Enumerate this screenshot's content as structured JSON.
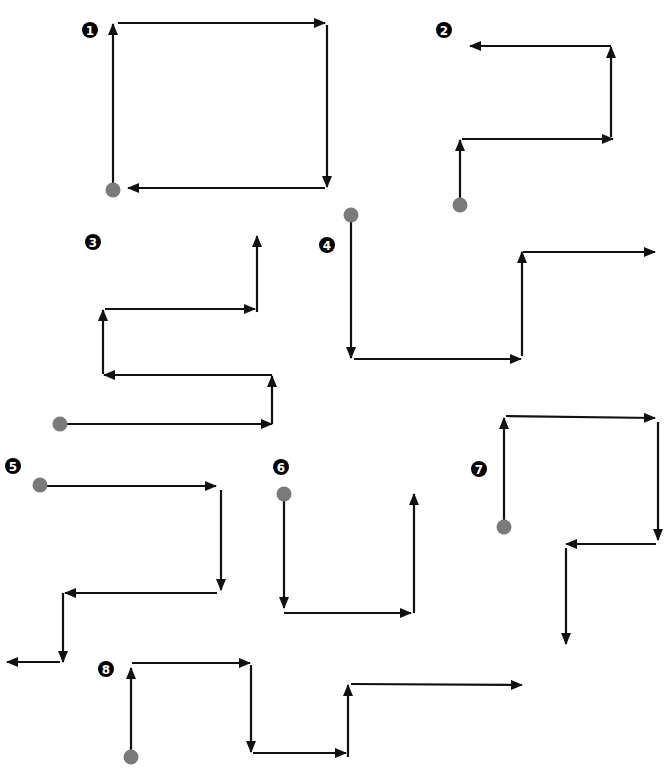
{
  "colors": {
    "arrow": "#111111",
    "start_dot": "#7a7a7a",
    "badge_bg": "#000000",
    "badge_text": "#ffffff",
    "background": "#ffffff"
  },
  "figures": [
    {
      "label": "1",
      "badge": [
        90,
        30
      ],
      "start": [
        113,
        190
      ],
      "segments": [
        [
          [
            113,
            184
          ],
          [
            113,
            24
          ]
        ],
        [
          [
            118,
            23
          ],
          [
            325,
            23
          ]
        ],
        [
          [
            327,
            25
          ],
          [
            327,
            187
          ]
        ],
        [
          [
            325,
            188
          ],
          [
            128,
            188
          ]
        ]
      ]
    },
    {
      "label": "2",
      "badge": [
        444,
        30
      ],
      "start": [
        460,
        205
      ],
      "segments": [
        [
          [
            460,
            199
          ],
          [
            460,
            140
          ]
        ],
        [
          [
            462,
            139
          ],
          [
            613,
            139
          ]
        ],
        [
          [
            611,
            137
          ],
          [
            611,
            47
          ]
        ],
        [
          [
            611,
            46
          ],
          [
            470,
            46
          ]
        ]
      ]
    },
    {
      "label": "3",
      "badge": [
        93,
        242
      ],
      "start": [
        60,
        424
      ],
      "segments": [
        [
          [
            66,
            424
          ],
          [
            272,
            424
          ]
        ],
        [
          [
            272,
            424
          ],
          [
            272,
            376
          ]
        ],
        [
          [
            272,
            375
          ],
          [
            104,
            375
          ]
        ],
        [
          [
            103,
            374
          ],
          [
            103,
            310
          ]
        ],
        [
          [
            105,
            309
          ],
          [
            255,
            309
          ]
        ],
        [
          [
            257,
            312
          ],
          [
            257,
            236
          ]
        ]
      ]
    },
    {
      "label": "4",
      "badge": [
        327,
        245
      ],
      "start": [
        351,
        215
      ],
      "segments": [
        [
          [
            351,
            221
          ],
          [
            351,
            358
          ]
        ],
        [
          [
            354,
            359
          ],
          [
            521,
            359
          ]
        ],
        [
          [
            522,
            356
          ],
          [
            522,
            252
          ]
        ],
        [
          [
            523,
            252
          ],
          [
            655,
            252
          ]
        ]
      ]
    },
    {
      "label": "5",
      "badge": [
        13,
        466
      ],
      "start": [
        40,
        485
      ],
      "segments": [
        [
          [
            46,
            486
          ],
          [
            216,
            486
          ]
        ],
        [
          [
            221,
            490
          ],
          [
            221,
            590
          ]
        ],
        [
          [
            217,
            593
          ],
          [
            65,
            593
          ]
        ],
        [
          [
            63,
            593
          ],
          [
            63,
            662
          ]
        ],
        [
          [
            60,
            662
          ],
          [
            7,
            662
          ]
        ]
      ]
    },
    {
      "label": "6",
      "badge": [
        281,
        467
      ],
      "start": [
        284,
        494
      ],
      "segments": [
        [
          [
            284,
            500
          ],
          [
            284,
            608
          ]
        ],
        [
          [
            284,
            613
          ],
          [
            411,
            613
          ]
        ],
        [
          [
            414,
            613
          ],
          [
            414,
            494
          ]
        ]
      ]
    },
    {
      "label": "7",
      "badge": [
        479,
        469
      ],
      "start": [
        504,
        527
      ],
      "segments": [
        [
          [
            504,
            521
          ],
          [
            504,
            418
          ]
        ],
        [
          [
            506,
            416
          ],
          [
            655,
            418
          ]
        ],
        [
          [
            658,
            422
          ],
          [
            658,
            540
          ]
        ],
        [
          [
            656,
            544
          ],
          [
            566,
            544
          ]
        ],
        [
          [
            566,
            548
          ],
          [
            566,
            644
          ]
        ]
      ]
    },
    {
      "label": "8",
      "badge": [
        106,
        669
      ],
      "start": [
        131,
        757
      ],
      "segments": [
        [
          [
            131,
            751
          ],
          [
            131,
            668
          ]
        ],
        [
          [
            132,
            663
          ],
          [
            250,
            663
          ]
        ],
        [
          [
            251,
            665
          ],
          [
            251,
            752
          ]
        ],
        [
          [
            253,
            753
          ],
          [
            346,
            753
          ]
        ],
        [
          [
            348,
            757
          ],
          [
            348,
            685
          ]
        ],
        [
          [
            351,
            684
          ],
          [
            522,
            685
          ]
        ]
      ]
    }
  ]
}
